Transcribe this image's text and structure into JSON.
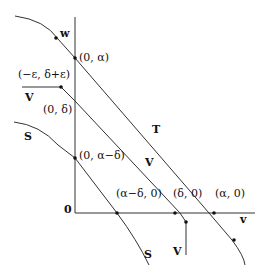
{
  "diagram": {
    "curves": {
      "w_curve": "w",
      "T_line": "T",
      "V_line_upper": "V",
      "V_line_diag": "V",
      "S_curve_left": "S",
      "S_curve_bottom": "S",
      "V_line_bottom": "V",
      "v_curve": "v"
    },
    "points": {
      "p_0_alpha": "(0, α)",
      "p_eps": "(−ε, δ+ε)",
      "p_0_delta": "(0, δ)",
      "p_0_alpha_minus_delta": "(0, α−δ)",
      "p_alpha_minus_delta_0": "(α−δ, 0)",
      "p_delta_0": "(δ, 0)",
      "p_alpha_0": "(α, 0)"
    },
    "origin": "0"
  }
}
